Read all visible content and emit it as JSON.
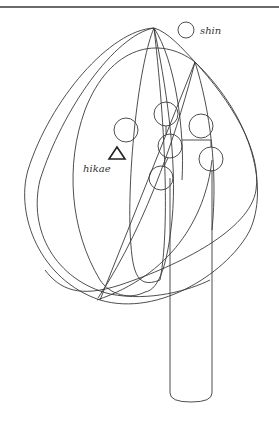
{
  "figure": {
    "labels": {
      "shin": "shin",
      "hikae": "hikae"
    },
    "markers": {
      "shin_marker": "circle",
      "hikae_marker": "triangle"
    },
    "elements": {
      "vase": "cylinder-vase",
      "stems": "curved-stem-lines",
      "flowers": 6
    },
    "colors": {
      "line": "#3a3a3a",
      "background": "#ffffff",
      "top_rule": "#6a6a6a"
    }
  }
}
